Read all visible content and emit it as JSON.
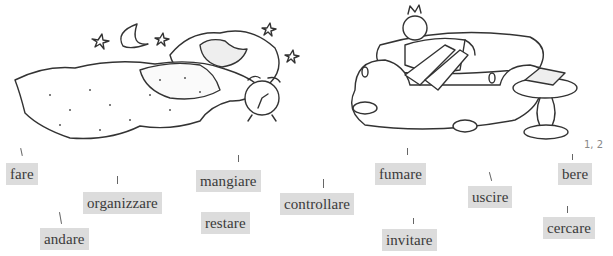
{
  "illustrations": [
    {
      "name": "sleeping-in-bed",
      "description": "Person sleeping under a dotted duvet at night with moon, stars and an alarm clock"
    },
    {
      "name": "lounging-on-sofa",
      "description": "Bored man slouched on a sofa next to a side table with a telephone"
    }
  ],
  "handwritten_note": "1, 2",
  "labels": [
    {
      "id": "fare",
      "text": "fare"
    },
    {
      "id": "organizzare",
      "text": "organizzare"
    },
    {
      "id": "andare",
      "text": "andare"
    },
    {
      "id": "mangiare",
      "text": "mangiare"
    },
    {
      "id": "restare",
      "text": "restare"
    },
    {
      "id": "controllare",
      "text": "controllare"
    },
    {
      "id": "fumare",
      "text": "fumare"
    },
    {
      "id": "invitare",
      "text": "invitare"
    },
    {
      "id": "uscire",
      "text": "uscire"
    },
    {
      "id": "bere",
      "text": "bere"
    },
    {
      "id": "cercare",
      "text": "cercare"
    }
  ],
  "colors": {
    "label_bg": "#dcdcdc",
    "label_text": "#3a3a3a",
    "ink": "#333333"
  }
}
